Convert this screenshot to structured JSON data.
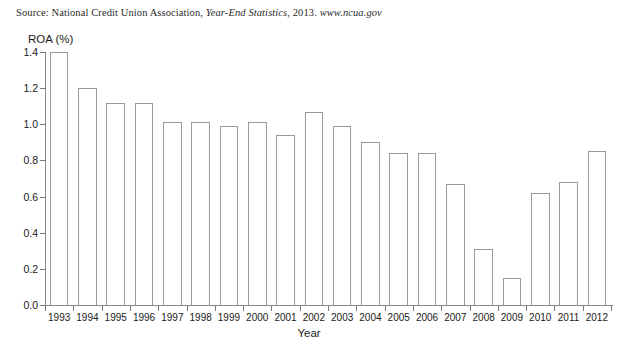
{
  "source_note": {
    "prefix": "Source: National Credit Union Association, ",
    "italic_title": "Year-End Statistics",
    "middle": ", 2013. ",
    "italic_url": "www.ncua.gov",
    "full_text": "Source: National Credit Union Association, Year-End Statistics, 2013. www.ncua.gov"
  },
  "chart_data": {
    "type": "bar",
    "title": "",
    "subtitle": "",
    "xlabel": "Year",
    "ylabel": "ROA (%)",
    "ylim": [
      0.0,
      1.4
    ],
    "ytick_labels": [
      "0.0",
      "0.2",
      "0.4",
      "0.6",
      "0.8",
      "1.0",
      "1.2",
      "1.4"
    ],
    "ytick_values": [
      0.0,
      0.2,
      0.4,
      0.6,
      0.8,
      1.0,
      1.2,
      1.4
    ],
    "grid": false,
    "legend": null,
    "legend_position": "none",
    "bar_style": {
      "fill": "#ffffff",
      "edge": "#9a9a9a"
    },
    "categories": [
      "1993",
      "1994",
      "1995",
      "1996",
      "1997",
      "1998",
      "1999",
      "2000",
      "2001",
      "2002",
      "2003",
      "2004",
      "2005",
      "2006",
      "2007",
      "2008",
      "2009",
      "2010",
      "2011",
      "2012"
    ],
    "values": [
      1.4,
      1.2,
      1.12,
      1.12,
      1.01,
      1.01,
      0.99,
      1.01,
      0.94,
      1.07,
      0.99,
      0.9,
      0.84,
      0.84,
      0.67,
      0.31,
      0.15,
      0.62,
      0.68,
      0.85
    ],
    "series": [
      {
        "name": "ROA (%)",
        "values": [
          1.4,
          1.2,
          1.12,
          1.12,
          1.01,
          1.01,
          0.99,
          1.01,
          0.94,
          1.07,
          0.99,
          0.9,
          0.84,
          0.84,
          0.67,
          0.31,
          0.15,
          0.62,
          0.68,
          0.85
        ]
      }
    ],
    "annotations": []
  }
}
